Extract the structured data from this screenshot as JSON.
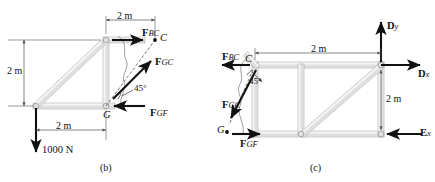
{
  "figure": {
    "title_b": "(b)",
    "title_c": "(c)",
    "panels": [
      {
        "id": "b",
        "caption": "(b)",
        "dimensions": [
          {
            "name": "top-span",
            "text": "2 m"
          },
          {
            "name": "left-height",
            "text": "2 m"
          },
          {
            "name": "bottom-span",
            "text": "2 m"
          }
        ],
        "points": [
          {
            "name": "C",
            "label": "C"
          },
          {
            "name": "G",
            "label": "G"
          }
        ],
        "forces": [
          {
            "name": "F_BC",
            "symbol": "F",
            "subscript": "BC",
            "direction": "right"
          },
          {
            "name": "F_GC",
            "symbol": "F",
            "subscript": "GC",
            "direction": "up-right-45"
          },
          {
            "name": "F_GF",
            "symbol": "F",
            "subscript": "GF",
            "direction": "left"
          },
          {
            "name": "applied-load",
            "symbol": "1000 N",
            "subscript": "",
            "direction": "down"
          }
        ],
        "angle": "45°",
        "load_label": "1000 N"
      },
      {
        "id": "c",
        "caption": "(c)",
        "dimensions": [
          {
            "name": "top-span",
            "text": "2 m"
          },
          {
            "name": "right-height",
            "text": "2 m"
          }
        ],
        "points": [
          {
            "name": "C",
            "label": "C"
          },
          {
            "name": "G",
            "label": "G"
          }
        ],
        "forces": [
          {
            "name": "F_BC",
            "symbol": "F",
            "subscript": "BC",
            "direction": "left"
          },
          {
            "name": "F_GC",
            "symbol": "F",
            "subscript": "GC",
            "direction": "down-left-45"
          },
          {
            "name": "F_GF",
            "symbol": "F",
            "subscript": "GF",
            "direction": "right"
          },
          {
            "name": "D_y",
            "symbol": "D",
            "subscript": "y",
            "direction": "up"
          },
          {
            "name": "D_x",
            "symbol": "D",
            "subscript": "x",
            "direction": "right"
          },
          {
            "name": "E_x",
            "symbol": "E",
            "subscript": "x",
            "direction": "left"
          }
        ],
        "angle": "45°"
      }
    ],
    "labels": {
      "two_m": "2 m",
      "angle_45": "45°",
      "load_1000": "1000 N",
      "point_C": "C",
      "point_G": "G",
      "f_bc_main": "F",
      "f_bc_sub": "BC",
      "f_gc_main": "F",
      "f_gc_sub": "GC",
      "f_gf_main": "F",
      "f_gf_sub": "GF",
      "d_main": "D",
      "d_y_sub": "y",
      "d_x_sub": "x",
      "e_main": "E",
      "e_x_sub": "x",
      "caption_b": "(b)",
      "caption_c": "(c)"
    },
    "colors": {
      "member_fill": "#e8e8e8",
      "member_edge": "#9a9a9a",
      "arrow": "#111111",
      "dimension_line": "#555555",
      "background": "#ffffff"
    }
  }
}
